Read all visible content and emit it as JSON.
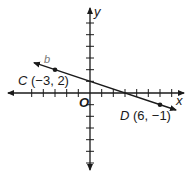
{
  "diagram": {
    "type": "coordinate-plane",
    "axes": {
      "x_label": "x",
      "y_label": "y",
      "origin_label": "O",
      "x_ticks": [
        -5,
        -4,
        -3,
        -2,
        -1,
        1,
        2,
        3,
        4,
        5,
        6,
        7
      ],
      "y_ticks": [
        6,
        5,
        4,
        3,
        2,
        1,
        -1,
        -2,
        -3,
        -4,
        -5,
        -6
      ],
      "unit_px": 11.67,
      "origin_px": [
        90,
        93
      ]
    },
    "line": {
      "name": "b",
      "through": [
        "C",
        "D"
      ],
      "color": "#1a1a1a"
    },
    "points": [
      {
        "name": "C",
        "coords_text": "(−3, 2)",
        "x": -3,
        "y": 2
      },
      {
        "name": "D",
        "coords_text": "(6, −1)",
        "x": 6,
        "y": -1
      }
    ]
  }
}
